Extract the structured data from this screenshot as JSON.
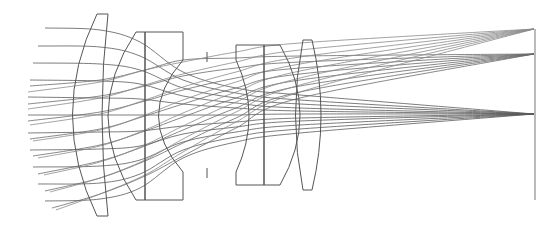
{
  "diagram": {
    "type": "optical-ray-trace",
    "width": 560,
    "height": 228,
    "colors": {
      "background": "#ffffff",
      "lens_outline": "#555555",
      "image_plane": "#777777",
      "ray_dark": "#555555",
      "ray_light": "#9a9a9a"
    },
    "elements": [
      {
        "id": "lens-1",
        "kind": "biconvex-meniscus",
        "path": "M97,14 L108,14 Q96,115 108,216 L97,216 Q48,115 97,14 Z"
      },
      {
        "id": "lens-2-front",
        "kind": "meniscus-cemented",
        "path": "M136,32 L145,32 L145,200 L136,200 Q80,116 136,32 Z"
      },
      {
        "id": "lens-2-rear",
        "kind": "plano-concave-cemented",
        "path": "M145,32 L183,32 L183,60 Q134,116 183,172 L183,200 L145,200 Z"
      },
      {
        "id": "lens-3-front",
        "kind": "biconcave-cemented",
        "path": "M236,45 L264,45 L264,185 L236,185 L236,172 Q262,116 236,60 Z"
      },
      {
        "id": "lens-3-rear",
        "kind": "plano-convex-cemented",
        "path": "M264,45 L280,45 Q320,115 280,185 L264,185 Z"
      },
      {
        "id": "lens-4",
        "kind": "biconvex",
        "path": "M303,40 L312,40 Q330,115 312,190 L303,190 Q288,115 303,40 Z"
      }
    ],
    "aperture_stop": {
      "x": 207,
      "top": [
        52,
        62
      ],
      "bottom": [
        168,
        178
      ]
    },
    "image_plane": {
      "x": 535,
      "y1": 29,
      "y2": 200
    },
    "field_points": [
      {
        "name": "full-field",
        "focus": [
          534,
          29
        ],
        "shade": "light"
      },
      {
        "name": "mid-field",
        "focus": [
          534,
          54
        ],
        "shade": "light"
      },
      {
        "name": "on-axis",
        "focus": [
          534,
          114
        ],
        "shade": "dark"
      }
    ],
    "ray_bundles": [
      {
        "field": "on-axis",
        "color": "#5a5a5a",
        "rays": [
          [
            [
              45,
              28
            ],
            [
              100,
              30
            ],
            [
              140,
              42
            ],
            [
              183,
              72
            ],
            [
              236,
              88
            ],
            [
              300,
              95
            ],
            [
              534,
              114
            ]
          ],
          [
            [
              38,
              46
            ],
            [
              100,
              47
            ],
            [
              140,
              56
            ],
            [
              183,
              80
            ],
            [
              236,
              93
            ],
            [
              300,
              100
            ],
            [
              534,
              114
            ]
          ],
          [
            [
              33,
              63
            ],
            [
              100,
              64
            ],
            [
              140,
              70
            ],
            [
              183,
              88
            ],
            [
              236,
              98
            ],
            [
              300,
              104
            ],
            [
              534,
              114
            ]
          ],
          [
            [
              30,
              80
            ],
            [
              100,
              81
            ],
            [
              140,
              84
            ],
            [
              183,
              96
            ],
            [
              236,
              103
            ],
            [
              300,
              108
            ],
            [
              534,
              114
            ]
          ],
          [
            [
              28,
              97
            ],
            [
              100,
              98
            ],
            [
              140,
              99
            ],
            [
              183,
              104
            ],
            [
              236,
              108
            ],
            [
              300,
              111
            ],
            [
              534,
              114
            ]
          ],
          [
            [
              28,
              115
            ],
            [
              100,
              115
            ],
            [
              140,
              115
            ],
            [
              183,
              115
            ],
            [
              236,
              115
            ],
            [
              300,
              114
            ],
            [
              534,
              114
            ]
          ],
          [
            [
              28,
              133
            ],
            [
              100,
              132
            ],
            [
              140,
              131
            ],
            [
              183,
              126
            ],
            [
              236,
              122
            ],
            [
              300,
              118
            ],
            [
              534,
              114
            ]
          ],
          [
            [
              30,
              150
            ],
            [
              100,
              149
            ],
            [
              140,
              146
            ],
            [
              183,
              134
            ],
            [
              236,
              127
            ],
            [
              300,
              121
            ],
            [
              534,
              114
            ]
          ],
          [
            [
              33,
              167
            ],
            [
              100,
              166
            ],
            [
              140,
              160
            ],
            [
              183,
              142
            ],
            [
              236,
              132
            ],
            [
              300,
              125
            ],
            [
              534,
              114
            ]
          ],
          [
            [
              38,
              184
            ],
            [
              100,
              183
            ],
            [
              140,
              174
            ],
            [
              183,
              150
            ],
            [
              236,
              137
            ],
            [
              300,
              129
            ],
            [
              534,
              114
            ]
          ],
          [
            [
              45,
              201
            ],
            [
              100,
              199
            ],
            [
              140,
              188
            ],
            [
              183,
              158
            ],
            [
              236,
              142
            ],
            [
              300,
              133
            ],
            [
              534,
              114
            ]
          ]
        ]
      },
      {
        "field": "mid-field",
        "color": "#6a6a6a",
        "rays": [
          [
            [
              30,
              86
            ],
            [
              100,
              80
            ],
            [
              145,
              70
            ],
            [
              183,
              60
            ],
            [
              236,
              58
            ],
            [
              300,
              56
            ],
            [
              534,
              54
            ]
          ],
          [
            [
              28,
              104
            ],
            [
              100,
              96
            ],
            [
              145,
              86
            ],
            [
              183,
              76
            ],
            [
              236,
              68
            ],
            [
              300,
              62
            ],
            [
              534,
              54
            ]
          ],
          [
            [
              28,
              121
            ],
            [
              100,
              112
            ],
            [
              145,
              101
            ],
            [
              183,
              90
            ],
            [
              236,
              78
            ],
            [
              300,
              68
            ],
            [
              534,
              54
            ]
          ],
          [
            [
              30,
              139
            ],
            [
              100,
              129
            ],
            [
              145,
              116
            ],
            [
              183,
              104
            ],
            [
              236,
              88
            ],
            [
              300,
              74
            ],
            [
              534,
              54
            ]
          ],
          [
            [
              33,
              156
            ],
            [
              100,
              145
            ],
            [
              145,
              131
            ],
            [
              183,
              117
            ],
            [
              236,
              98
            ],
            [
              300,
              80
            ],
            [
              534,
              54
            ]
          ],
          [
            [
              38,
              174
            ],
            [
              100,
              161
            ],
            [
              145,
              146
            ],
            [
              183,
              130
            ],
            [
              236,
              108
            ],
            [
              300,
              86
            ],
            [
              534,
              54
            ]
          ],
          [
            [
              45,
              191
            ],
            [
              100,
              178
            ],
            [
              145,
              161
            ],
            [
              183,
              143
            ],
            [
              236,
              118
            ],
            [
              300,
              92
            ],
            [
              534,
              54
            ]
          ],
          [
            [
              52,
              208
            ],
            [
              100,
              194
            ],
            [
              145,
              176
            ],
            [
              183,
              156
            ],
            [
              236,
              128
            ],
            [
              300,
              98
            ],
            [
              534,
              54
            ]
          ]
        ]
      },
      {
        "field": "full-field",
        "color": "#8a8a8a",
        "rays": [
          [
            [
              28,
              92
            ],
            [
              100,
              82
            ],
            [
              145,
              70
            ],
            [
              183,
              62
            ],
            [
              236,
              52
            ],
            [
              300,
              43
            ],
            [
              534,
              29
            ]
          ],
          [
            [
              28,
              109
            ],
            [
              100,
              98
            ],
            [
              145,
              85
            ],
            [
              183,
              74
            ],
            [
              236,
              62
            ],
            [
              300,
              50
            ],
            [
              534,
              29
            ]
          ],
          [
            [
              30,
              125
            ],
            [
              100,
              114
            ],
            [
              145,
              100
            ],
            [
              183,
              87
            ],
            [
              236,
              72
            ],
            [
              300,
              57
            ],
            [
              534,
              29
            ]
          ],
          [
            [
              33,
              141
            ],
            [
              100,
              130
            ],
            [
              145,
              115
            ],
            [
              183,
              100
            ],
            [
              236,
              82
            ],
            [
              300,
              64
            ],
            [
              534,
              29
            ]
          ],
          [
            [
              38,
              158
            ],
            [
              100,
              146
            ],
            [
              145,
              130
            ],
            [
              183,
              113
            ],
            [
              236,
              92
            ],
            [
              300,
              71
            ],
            [
              534,
              29
            ]
          ],
          [
            [
              44,
              175
            ],
            [
              100,
              162
            ],
            [
              145,
              145
            ],
            [
              183,
              126
            ],
            [
              236,
              102
            ],
            [
              300,
              78
            ],
            [
              534,
              29
            ]
          ],
          [
            [
              50,
              192
            ],
            [
              100,
              178
            ],
            [
              145,
              160
            ],
            [
              183,
              139
            ],
            [
              236,
              112
            ],
            [
              300,
              85
            ],
            [
              534,
              29
            ]
          ],
          [
            [
              56,
              210
            ],
            [
              100,
              194
            ],
            [
              145,
              175
            ],
            [
              183,
              152
            ],
            [
              236,
              122
            ],
            [
              300,
              92
            ],
            [
              534,
              29
            ]
          ]
        ]
      }
    ]
  }
}
